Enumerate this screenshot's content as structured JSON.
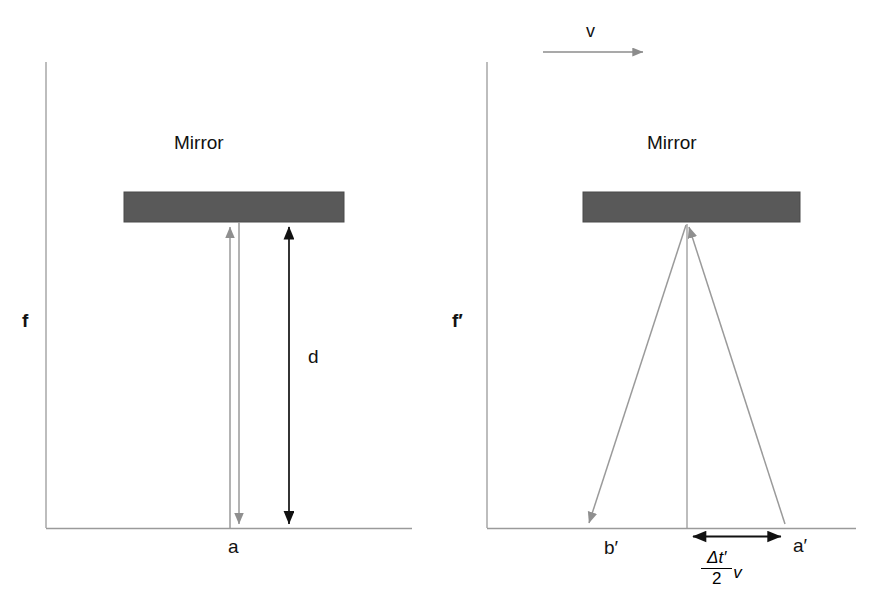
{
  "figure": {
    "background_color": "#ffffff"
  },
  "colors": {
    "mirror_fill": "#595959",
    "mirror_stroke": "#4a4a4a",
    "axis_line": "#9a9a9a",
    "light_ray": "#9a9a9a",
    "dimension_arrow": "#111111",
    "velocity_arrow": "#8c8c8c",
    "text": "#111111"
  },
  "panels": [
    {
      "id": "rest-frame",
      "frame_label": "f",
      "mirror_label": "Mirror",
      "baseline_point_label": "a",
      "distance_label": "d",
      "description": "Light travels straight up to the mirror and back down to point a in the rest frame."
    },
    {
      "id": "moving-frame",
      "frame_label": "f′",
      "mirror_label": "Mirror",
      "velocity_label": "v",
      "left_point_label": "b′",
      "right_point_label": "a′",
      "displacement": {
        "numerator": "Δt′",
        "denominator": "2",
        "multiplier": "v"
      },
      "description": "In the moving frame the light path is a triangle; the apparatus shifts by (Δt′/2)v."
    }
  ]
}
